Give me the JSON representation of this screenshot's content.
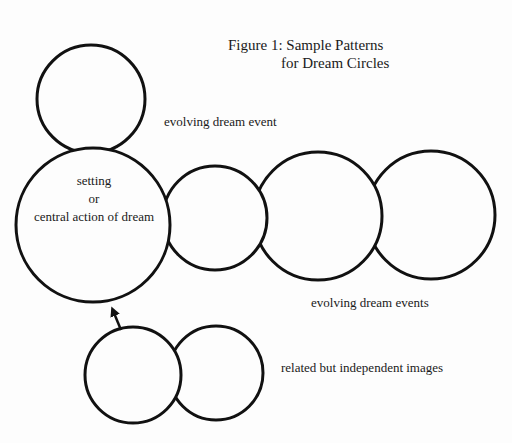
{
  "figure": {
    "title_line1": "Figure 1: Sample Patterns",
    "title_line2": "for Dream Circles"
  },
  "labels": {
    "center_line1": "setting",
    "center_line2": "or",
    "center_line3": "central action of dream",
    "evolving_event": "evolving dream event",
    "evolving_events": "evolving dream events",
    "related_images": "related but independent images"
  },
  "circles": [
    {
      "id": "top",
      "cx": 91,
      "cy": 99,
      "r": 54
    },
    {
      "id": "central",
      "cx": 93,
      "cy": 225,
      "r": 77
    },
    {
      "id": "chain-1",
      "cx": 215,
      "cy": 218,
      "r": 52
    },
    {
      "id": "chain-2",
      "cx": 318,
      "cy": 216,
      "r": 64
    },
    {
      "id": "chain-3",
      "cx": 431,
      "cy": 215,
      "r": 64
    },
    {
      "id": "related-1",
      "cx": 133,
      "cy": 375,
      "r": 48
    },
    {
      "id": "related-2",
      "cx": 216,
      "cy": 373,
      "r": 47
    }
  ],
  "arrow": {
    "from": [
      120,
      330
    ],
    "to": [
      112,
      307
    ]
  },
  "colors": {
    "stroke": "#111111",
    "background": "#fdfdfd",
    "text": "#1a1a1a"
  }
}
